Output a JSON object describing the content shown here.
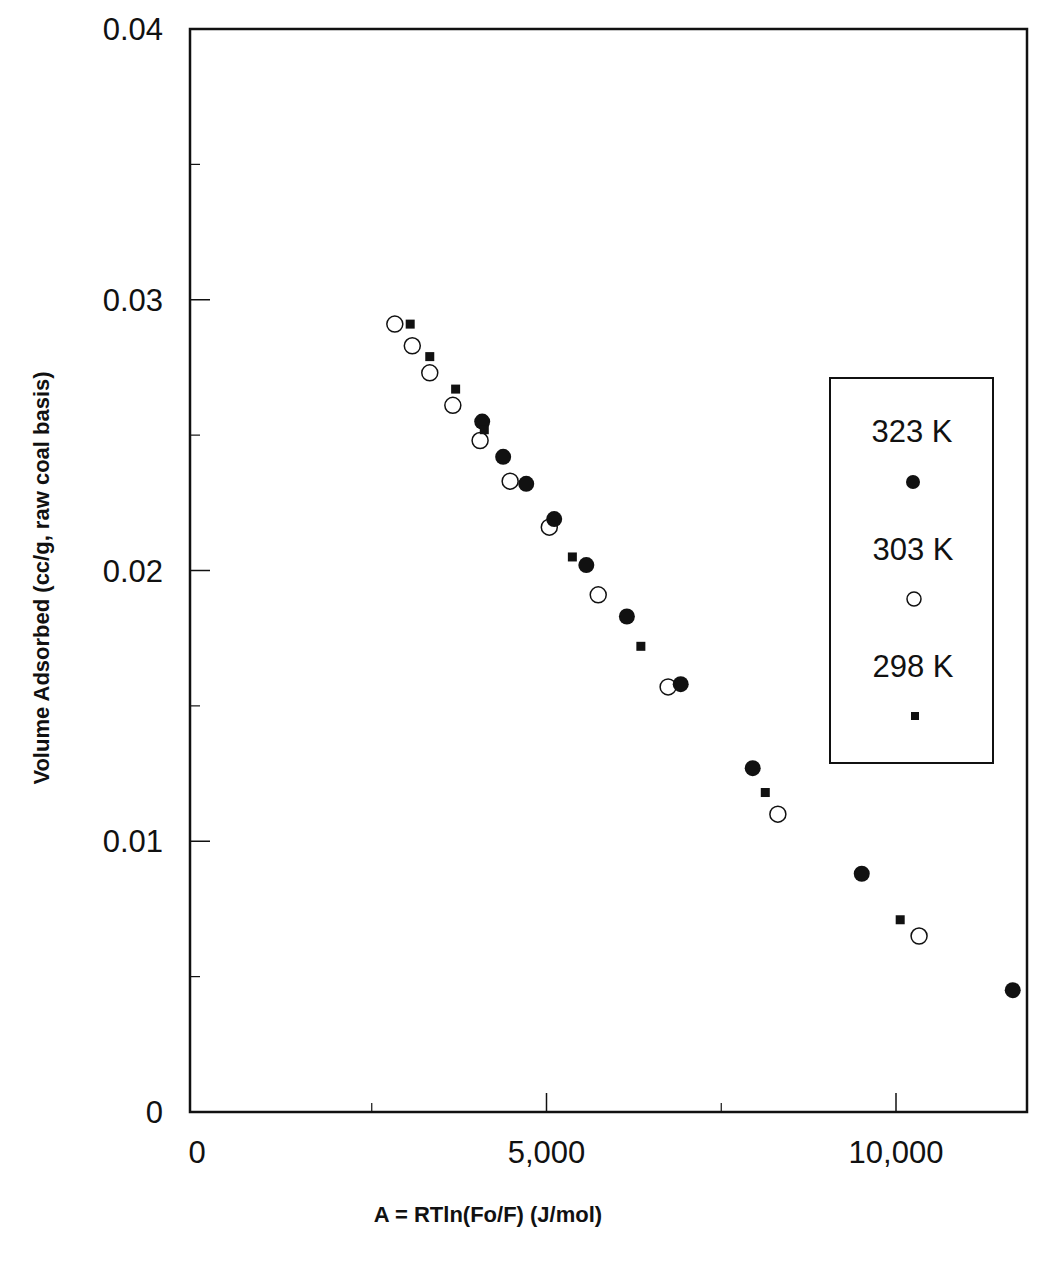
{
  "chart_data": {
    "type": "scatter",
    "title": "",
    "xlabel": "A = RTln(Fo/F) (J/mol)",
    "ylabel": "Volume Adsorbed (cc/g, raw coal basis)",
    "xlim": [
      0,
      12000
    ],
    "ylim": [
      0,
      0.04
    ],
    "grid": false,
    "legend_position": "right, inside plot",
    "x_ticks": [
      {
        "value": 0,
        "label": "0"
      },
      {
        "value": 5000,
        "label": "5,000"
      },
      {
        "value": 10000,
        "label": "10,000"
      }
    ],
    "x_minor_ticks": [
      2500,
      7500
    ],
    "y_ticks": [
      {
        "value": 0,
        "label": "0"
      },
      {
        "value": 0.01,
        "label": "0.01"
      },
      {
        "value": 0.02,
        "label": "0.02"
      },
      {
        "value": 0.03,
        "label": "0.03"
      },
      {
        "value": 0.04,
        "label": "0.04"
      }
    ],
    "y_minor_ticks": [
      0.005,
      0.015,
      0.025,
      0.035
    ],
    "series": [
      {
        "name": "323 K",
        "marker": "filled-circle",
        "color": "#111111",
        "points": [
          {
            "x": 4080,
            "y": 0.0255
          },
          {
            "x": 4380,
            "y": 0.0242
          },
          {
            "x": 4710,
            "y": 0.0232
          },
          {
            "x": 5110,
            "y": 0.0219
          },
          {
            "x": 5570,
            "y": 0.0202
          },
          {
            "x": 6150,
            "y": 0.0183
          },
          {
            "x": 6920,
            "y": 0.0158
          },
          {
            "x": 7950,
            "y": 0.0127
          },
          {
            "x": 9510,
            "y": 0.0088
          },
          {
            "x": 11670,
            "y": 0.0045
          }
        ]
      },
      {
        "name": "303 K",
        "marker": "open-circle",
        "color": "#111111",
        "points": [
          {
            "x": 2830,
            "y": 0.0291
          },
          {
            "x": 3080,
            "y": 0.0283
          },
          {
            "x": 3330,
            "y": 0.0273
          },
          {
            "x": 3660,
            "y": 0.0261
          },
          {
            "x": 4050,
            "y": 0.0248
          },
          {
            "x": 4480,
            "y": 0.0233
          },
          {
            "x": 5040,
            "y": 0.0216
          },
          {
            "x": 5740,
            "y": 0.0191
          },
          {
            "x": 6740,
            "y": 0.0157
          },
          {
            "x": 8310,
            "y": 0.011
          },
          {
            "x": 10330,
            "y": 0.0065
          }
        ]
      },
      {
        "name": "298 K",
        "marker": "filled-square",
        "color": "#111111",
        "points": [
          {
            "x": 3050,
            "y": 0.0291
          },
          {
            "x": 3330,
            "y": 0.0279
          },
          {
            "x": 3700,
            "y": 0.0267
          },
          {
            "x": 4110,
            "y": 0.0252
          },
          {
            "x": 5370,
            "y": 0.0205
          },
          {
            "x": 6350,
            "y": 0.0172
          },
          {
            "x": 8130,
            "y": 0.0118
          },
          {
            "x": 10060,
            "y": 0.0071
          }
        ]
      }
    ]
  },
  "legend": {
    "items": [
      {
        "label": "323 K",
        "marker": "filled-circle"
      },
      {
        "label": "303 K",
        "marker": "open-circle"
      },
      {
        "label": "298 K",
        "marker": "filled-square"
      }
    ]
  },
  "axes": {
    "x_title": "A = RTln(Fo/F) (J/mol)",
    "y_title": "Volume Adsorbed (cc/g, raw coal basis)"
  },
  "colors": {
    "ink": "#111111",
    "background": "#ffffff"
  }
}
